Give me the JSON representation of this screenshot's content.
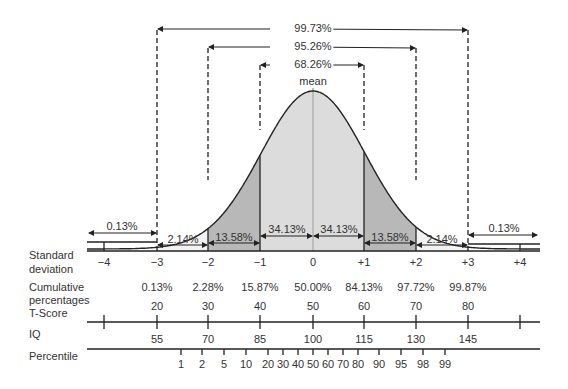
{
  "chart_data": {
    "type": "area",
    "mean_label": "mean",
    "sd_x_positions": {
      "-4": 104,
      "-3": 157,
      "-2": 208,
      "-1": 260,
      "0": 313,
      "1": 364,
      "2": 416,
      "3": 468,
      "4": 520
    },
    "spans": [
      {
        "label": "99.73%",
        "from": -3,
        "to": 3
      },
      {
        "label": "95.26%",
        "from": -2,
        "to": 2
      },
      {
        "label": "68.26%",
        "from": -1,
        "to": 1
      }
    ],
    "bands": [
      {
        "label": "0.13%",
        "from": -4,
        "to": -3
      },
      {
        "label": "2.14%",
        "from": -3,
        "to": -2
      },
      {
        "label": "13.58%",
        "from": -2,
        "to": -1
      },
      {
        "label": "34.13%",
        "from": -1,
        "to": 0
      },
      {
        "label": "34.13%",
        "from": 0,
        "to": 1
      },
      {
        "label": "13.58%",
        "from": 1,
        "to": 2
      },
      {
        "label": "2.14%",
        "from": 2,
        "to": 3
      },
      {
        "label": "0.13%",
        "from": 3,
        "to": 4
      }
    ],
    "rows": {
      "standard_deviation": {
        "label": "Standard deviation",
        "ticks": [
          "−4",
          "−3",
          "−2",
          "−1",
          "0",
          "+1",
          "+2",
          "+3",
          "+4"
        ]
      },
      "cumulative_percentages": {
        "label": "Cumulative percentages",
        "values": [
          "0.13%",
          "2.28%",
          "15.87%",
          "50.00%",
          "84.13%",
          "97.72%",
          "99.87%"
        ]
      },
      "t_score": {
        "label": "T-Score",
        "values": [
          "20",
          "30",
          "40",
          "50",
          "60",
          "70",
          "80"
        ]
      },
      "iq": {
        "label": "IQ",
        "values": [
          "55",
          "70",
          "85",
          "100",
          "115",
          "130",
          "145"
        ]
      },
      "percentile": {
        "label": "Percentile",
        "values": [
          "1",
          "2",
          "5",
          "10",
          "20",
          "30",
          "40",
          "50",
          "60",
          "70",
          "80",
          "90",
          "95",
          "98",
          "99"
        ]
      }
    },
    "colors": {
      "center": "#dcdcdc",
      "mid": "#b8b8b8",
      "tail": "#f2f2f2",
      "line": "#222222",
      "mean_line": "#bdbdbd"
    }
  },
  "labels": {
    "sd_row_line1": "Standard",
    "sd_row_line2": "deviation",
    "cum_line1": "Cumulative",
    "cum_line2": "percentages",
    "tscore": "T-Score",
    "iq": "IQ",
    "percentile": "Percentile",
    "mean": "mean",
    "span_9973": "99.73%",
    "span_9526": "95.26%",
    "span_6826": "68.26%",
    "band_l4": "0.13%",
    "band_l3": "2.14%",
    "band_l2": "13.58%",
    "band_l1": "34.13%",
    "band_r1": "34.13%",
    "band_r2": "13.58%",
    "band_r3": "2.14%",
    "band_r4": "0.13%",
    "sd": [
      "−4",
      "−3",
      "−2",
      "−1",
      "0",
      "+1",
      "+2",
      "+3",
      "+4"
    ],
    "cum": [
      "0.13%",
      "2.28%",
      "15.87%",
      "50.00%",
      "84.13%",
      "97.72%",
      "99.87%"
    ],
    "t": [
      "20",
      "30",
      "40",
      "50",
      "60",
      "70",
      "80"
    ],
    "iqv": [
      "55",
      "70",
      "85",
      "100",
      "115",
      "130",
      "145"
    ],
    "pct": [
      "1",
      "2",
      "5",
      "10",
      "20",
      "30",
      "40",
      "50",
      "60",
      "70",
      "80",
      "90",
      "95",
      "98",
      "99"
    ]
  }
}
